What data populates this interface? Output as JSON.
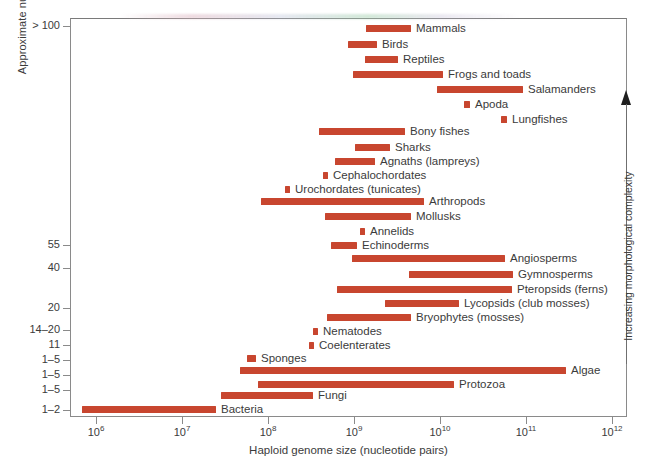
{
  "chart_data": {
    "type": "bar",
    "orientation": "horizontal-range",
    "title": "",
    "xlabel": "Haploid genome size (nucleotide pairs)",
    "ylabel": "Approximate number of cell types",
    "xscale": "log",
    "xlim": [
      1000000.0,
      1000000000000.0
    ],
    "grid": false,
    "legend": null,
    "bar_color": "#c8462f",
    "x_tick_labels": [
      "10⁶",
      "10⁷",
      "10⁸",
      "10⁹",
      "10¹⁰",
      "10¹¹",
      "10¹²"
    ],
    "x_ticks": [
      {
        "mantissa": "10",
        "exponent": "6",
        "value": 1000000.0,
        "px": 96
      },
      {
        "mantissa": "10",
        "exponent": "7",
        "value": 10000000.0,
        "px": 182
      },
      {
        "mantissa": "10",
        "exponent": "8",
        "value": 100000000.0,
        "px": 268
      },
      {
        "mantissa": "10",
        "exponent": "9",
        "value": 1000000000.0,
        "px": 354
      },
      {
        "mantissa": "10",
        "exponent": "10",
        "value": 10000000000.0,
        "px": 440
      },
      {
        "mantissa": "10",
        "exponent": "11",
        "value": 100000000000.0,
        "px": 526
      },
      {
        "mantissa": "10",
        "exponent": "12",
        "value": 1000000000000.0,
        "px": 612
      }
    ],
    "y_ticks": [
      {
        "label": "> 100",
        "px": 26
      },
      {
        "label": "55",
        "px": 245
      },
      {
        "label": "40",
        "px": 268
      },
      {
        "label": "20",
        "px": 308
      },
      {
        "label": "14–20",
        "px": 330
      },
      {
        "label": "11",
        "px": 345
      },
      {
        "label": "1–5",
        "px": 360
      },
      {
        "label": "1–5",
        "px": 375
      },
      {
        "label": "1–5",
        "px": 390
      },
      {
        "label": "1–2",
        "px": 410
      }
    ],
    "right_axis": {
      "label": "Increasing morphological complexity",
      "direction": "up",
      "arrow_icon": "up-arrow-icon"
    },
    "bars": [
      {
        "label": "Mammals",
        "x_start": 2600000000.0,
        "x_end": 4000000000.0,
        "px_start": 366,
        "px_end": 411,
        "px_top": 25,
        "label_px": 416
      },
      {
        "label": "Birds",
        "x_start": 1100000000.0,
        "x_end": 1900000000.0,
        "px_start": 348,
        "px_end": 377,
        "px_top": 41,
        "label_px": 382
      },
      {
        "label": "Reptiles",
        "x_start": 2400000000.0,
        "x_end": 4200000000.0,
        "px_start": 365,
        "px_end": 398,
        "px_top": 56,
        "label_px": 403
      },
      {
        "label": "Frogs and toads",
        "x_start": 1000000000.0,
        "x_end": 12000000000.0,
        "px_start": 353,
        "px_end": 443,
        "px_top": 71,
        "label_px": 448
      },
      {
        "label": "Salamanders",
        "x_start": 9500000000.0,
        "x_end": 100000000000.0,
        "px_start": 437,
        "px_end": 523,
        "px_top": 86,
        "label_px": 528
      },
      {
        "label": "Apoda",
        "x_start": 20000000000.0,
        "x_end": 25000000000.0,
        "px_start": 464,
        "px_end": 470,
        "px_top": 101,
        "label_px": 475
      },
      {
        "label": "Lungfishes",
        "x_start": 60000000000.0,
        "x_end": 70000000000.0,
        "px_start": 501,
        "px_end": 507,
        "px_top": 116,
        "label_px": 512
      },
      {
        "label": "Bony fishes",
        "x_start": 330000000.0,
        "x_end": 5500000000.0,
        "px_start": 319,
        "px_end": 405,
        "px_top": 128,
        "label_px": 410
      },
      {
        "label": "Sharks",
        "x_start": 1300000000.0,
        "x_end": 3500000000.0,
        "px_start": 355,
        "px_end": 390,
        "px_top": 144,
        "label_px": 395
      },
      {
        "label": "Agnaths (lampreys)",
        "x_start": 600000000.0,
        "x_end": 1800000000.0,
        "px_start": 335,
        "px_end": 375,
        "px_top": 158,
        "label_px": 380
      },
      {
        "label": "Cephalochordates",
        "x_start": 550000000.0,
        "x_end": 650000000.0,
        "px_start": 323,
        "px_end": 328,
        "px_top": 172,
        "label_px": 333
      },
      {
        "label": "Urochordates (tunicates)",
        "x_start": 200000000.0,
        "x_end": 240000000.0,
        "px_start": 285,
        "px_end": 290,
        "px_top": 186,
        "label_px": 295
      },
      {
        "label": "Arthropods",
        "x_start": 100000000.0,
        "x_end": 10000000000.0,
        "px_start": 261,
        "px_end": 424,
        "px_top": 198,
        "label_px": 429
      },
      {
        "label": "Mollusks",
        "x_start": 400000000.0,
        "x_end": 4000000000.0,
        "px_start": 325,
        "px_end": 411,
        "px_top": 213,
        "label_px": 416
      },
      {
        "label": "Annelids",
        "x_start": 1400000000.0,
        "x_end": 1700000000.0,
        "px_start": 360,
        "px_end": 365,
        "px_top": 228,
        "label_px": 370
      },
      {
        "label": "Echinoderms",
        "x_start": 500000000.0,
        "x_end": 1000000000.0,
        "px_start": 331,
        "px_end": 357,
        "px_top": 242,
        "label_px": 362
      },
      {
        "label": "Angiosperms",
        "x_start": 900000000.0,
        "x_end": 60000000000.0,
        "px_start": 352,
        "px_end": 505,
        "px_top": 255,
        "label_px": 510
      },
      {
        "label": "Gymnosperms",
        "x_start": 4000000000.0,
        "x_end": 80000000000.0,
        "px_start": 409,
        "px_end": 513,
        "px_top": 271,
        "label_px": 518
      },
      {
        "label": "Pteropsids (ferns)",
        "x_start": 500000000.0,
        "x_end": 75000000000.0,
        "px_start": 337,
        "px_end": 512,
        "px_top": 286,
        "label_px": 517
      },
      {
        "label": "Lycopsids (club mosses)",
        "x_start": 2500000000.0,
        "x_end": 6000000000.0,
        "px_start": 385,
        "px_end": 459,
        "px_top": 300,
        "label_px": 464
      },
      {
        "label": "Bryophytes (mosses)",
        "x_start": 450000000.0,
        "x_end": 4500000000.0,
        "px_start": 327,
        "px_end": 411,
        "px_top": 314,
        "label_px": 416
      },
      {
        "label": "Nematodes",
        "x_start": 80000000.0,
        "x_end": 90000000.0,
        "px_start": 313,
        "px_end": 318,
        "px_top": 328,
        "label_px": 323
      },
      {
        "label": "Coelenterates",
        "x_start": 300000000.0,
        "x_end": 350000000.0,
        "px_start": 309,
        "px_end": 314,
        "px_top": 342,
        "label_px": 319
      },
      {
        "label": "Sponges",
        "x_start": 60000000.0,
        "x_end": 90000000.0,
        "px_start": 247,
        "px_end": 256,
        "px_top": 355,
        "label_px": 261
      },
      {
        "label": "Algae",
        "x_start": 55000000.0,
        "x_end": 200000000000.0,
        "px_start": 240,
        "px_end": 566,
        "px_top": 367,
        "label_px": 571
      },
      {
        "label": "Protozoa",
        "x_start": 80000000.0,
        "x_end": 40000000000.0,
        "px_start": 258,
        "px_end": 454,
        "px_top": 381,
        "label_px": 459
      },
      {
        "label": "Fungi",
        "x_start": 8000000.0,
        "x_end": 200000000.0,
        "px_start": 221,
        "px_end": 313,
        "px_top": 392,
        "label_px": 318
      },
      {
        "label": "Bacteria",
        "x_start": 700000.0,
        "x_end": 28000000.0,
        "px_start": 82,
        "px_end": 216,
        "px_top": 406,
        "label_px": 221
      }
    ]
  }
}
